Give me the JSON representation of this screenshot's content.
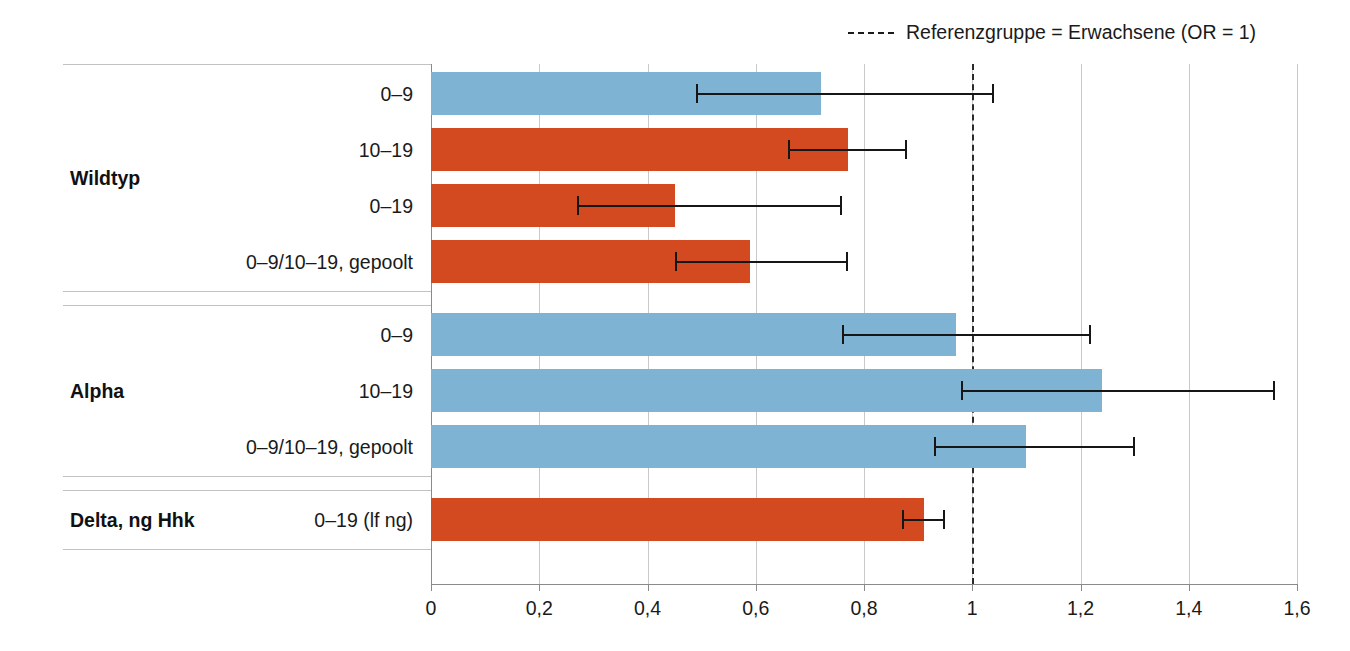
{
  "legend": {
    "icon": "dashed-line-icon",
    "label": "Referenzgruppe = Erwachsene (OR = 1)"
  },
  "colors": {
    "blue": "#7FB3D3",
    "orange": "#D34A20",
    "grid": "#c9c9c9",
    "axis": "#8a8a8a",
    "error": "#161616",
    "refline": "#2b2b2b"
  },
  "axis": {
    "ticks": [
      "0",
      "0,2",
      "0,4",
      "0,6",
      "0,8",
      "1",
      "1,2",
      "1,4",
      "1,6"
    ],
    "tick_values": [
      0,
      0.2,
      0.4,
      0.6,
      0.8,
      1,
      1.2,
      1.4,
      1.6
    ],
    "min": 0,
    "max": 1.6
  },
  "reference": {
    "value": 1,
    "label": "OR = 1"
  },
  "groups": [
    {
      "title": "Wildtyp",
      "rows": [
        {
          "label": "0–9",
          "value": 0.72,
          "ci_low": 0.49,
          "ci_high": 1.04,
          "color": "blue"
        },
        {
          "label": "10–19",
          "value": 0.77,
          "ci_low": 0.66,
          "ci_high": 0.88,
          "color": "orange"
        },
        {
          "label": "0–19",
          "value": 0.45,
          "ci_low": 0.27,
          "ci_high": 0.76,
          "color": "orange"
        },
        {
          "label": "0–9/10–19, gepoolt",
          "value": 0.59,
          "ci_low": 0.45,
          "ci_high": 0.77,
          "color": "orange"
        }
      ]
    },
    {
      "title": "Alpha",
      "rows": [
        {
          "label": "0–9",
          "value": 0.97,
          "ci_low": 0.76,
          "ci_high": 1.22,
          "color": "blue"
        },
        {
          "label": "10–19",
          "value": 1.24,
          "ci_low": 0.98,
          "ci_high": 1.56,
          "color": "blue"
        },
        {
          "label": "0–9/10–19, gepoolt",
          "value": 1.1,
          "ci_low": 0.93,
          "ci_high": 1.3,
          "color": "blue"
        }
      ]
    },
    {
      "title": "Delta, ng Hhk",
      "rows": [
        {
          "label": "0–19 (lf ng)",
          "value": 0.91,
          "ci_low": 0.87,
          "ci_high": 0.95,
          "color": "orange"
        }
      ]
    }
  ],
  "chart_data": {
    "type": "bar",
    "orientation": "horizontal",
    "title": "",
    "xlabel": "",
    "ylabel": "",
    "xlim": [
      0,
      1.6
    ],
    "xticks": [
      0,
      0.2,
      0.4,
      0.6,
      0.8,
      1,
      1.2,
      1.4,
      1.6
    ],
    "xticklabels": [
      "0",
      "0,2",
      "0,4",
      "0,6",
      "0,8",
      "1",
      "1,2",
      "1,4",
      "1,6"
    ],
    "grid": "vertical",
    "legend_position": "top-right",
    "legend_entries": [
      "Referenzgruppe = Erwachsene (OR = 1)"
    ],
    "annotations": [
      "Dashed vertical reference line at OR = 1"
    ],
    "categories": [
      "Wildtyp – 0–9",
      "Wildtyp – 10–19",
      "Wildtyp – 0–19",
      "Wildtyp – 0–9/10–19, gepoolt",
      "Alpha – 0–9",
      "Alpha – 10–19",
      "Alpha – 0–9/10–19, gepoolt",
      "Delta, ng Hhk – 0–19 (lf ng)"
    ],
    "values": [
      0.72,
      0.77,
      0.45,
      0.59,
      0.97,
      1.24,
      1.1,
      0.91
    ],
    "ci_low": [
      0.49,
      0.66,
      0.27,
      0.45,
      0.76,
      0.98,
      0.93,
      0.87
    ],
    "ci_high": [
      1.04,
      0.88,
      0.76,
      0.77,
      1.22,
      1.56,
      1.3,
      0.95
    ],
    "bar_colors": [
      "blue",
      "orange",
      "orange",
      "orange",
      "blue",
      "blue",
      "blue",
      "orange"
    ]
  }
}
